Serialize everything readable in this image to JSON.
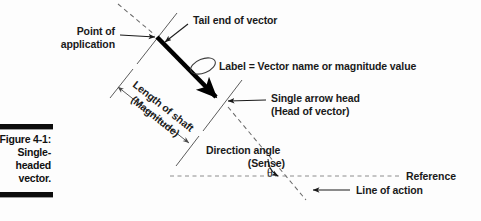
{
  "figure": {
    "number": "Figure 4-1:",
    "caption_lines": [
      "Single-",
      "headed",
      "vector."
    ]
  },
  "annotations": {
    "point_of_application": [
      "Point of",
      "application"
    ],
    "tail_end": "Tail end of vector",
    "label_note": "Label = Vector name or magnitude value",
    "length_of_shaft": [
      "Length of shaft",
      "(Magnitude)"
    ],
    "arrow_head": [
      "Single arrow head",
      "(Head of vector)"
    ],
    "direction_angle": [
      "Direction angle",
      "(Sense)"
    ],
    "theta_symbol": "θ",
    "reference": "Reference",
    "line_of_action": "Line of action"
  },
  "colors": {
    "background": "#fdfdfd",
    "vector": "#000000",
    "text": "#1a1a1a",
    "thin_line": "#4a4a4a",
    "dashed_line": "#8c8c8c",
    "caption_bar": "#0d0d0d"
  }
}
